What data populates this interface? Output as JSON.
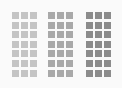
{
  "groups": [
    {
      "name": "light",
      "color": "#c4c4c4",
      "left": 12,
      "rows": 7,
      "cols": 3
    },
    {
      "name": "medium",
      "color": "#a9a9a9",
      "left": 48,
      "rows": 7,
      "cols": 3
    },
    {
      "name": "dark",
      "color": "#8c8c8c",
      "left": 86,
      "rows": 7,
      "cols": 3
    }
  ]
}
